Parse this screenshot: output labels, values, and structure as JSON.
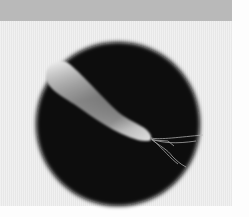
{
  "image": {
    "subject": "Electron micrograph of a rod-shaped bacterium with flagella",
    "colors": {
      "top_band": "#b9b9b9",
      "panel": "#ececec",
      "circle_field": "#0a0a0a",
      "bacterium_light": "#e8e8e8",
      "bacterium_dark": "#6f6f6f",
      "flagella": "#bdbdbd"
    }
  }
}
